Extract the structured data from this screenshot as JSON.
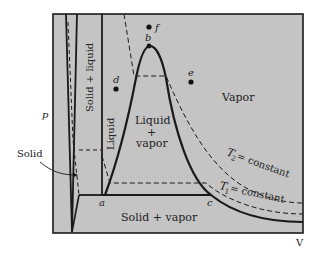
{
  "diagram": {
    "title": "",
    "axes": {
      "x_label": "V",
      "y_label": "p"
    },
    "colors": {
      "background": "#ffffff",
      "plot_fill": "#c4c4c4",
      "ink": "#1a1a1a"
    },
    "regions": {
      "solid": "Solid",
      "solid_liquid": "Solid + liquid",
      "liquid": "Liquid",
      "liquid_vapor_1": "Liquid",
      "liquid_vapor_2": "+",
      "liquid_vapor_3": "vapor",
      "vapor": "Vapor",
      "solid_vapor": "Solid + vapor"
    },
    "points": {
      "a": "a",
      "b": "b",
      "c": "c",
      "d": "d",
      "e": "e",
      "f": "f"
    },
    "isotherms": {
      "t2_symbol": "T",
      "t2_sub": "2",
      "t2_text": "= constant",
      "t1_symbol": "T",
      "t1_sub": "1",
      "t1_text": "= constant"
    }
  }
}
